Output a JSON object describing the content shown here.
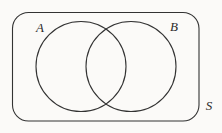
{
  "diagram": {
    "type": "venn-diagram",
    "set_a_label": "A",
    "set_b_label": "B",
    "universal_set_label": "S",
    "stroke_color": "#333333",
    "label_color": "#2b2b2b",
    "background_color": "#fbfaf8"
  }
}
